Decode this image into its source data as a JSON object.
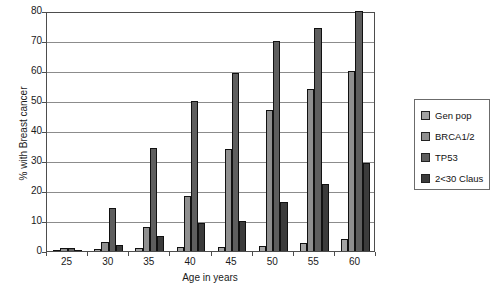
{
  "chart_data": {
    "type": "bar",
    "title": "",
    "xlabel": "Age in years",
    "ylabel": "% with Breast cancer",
    "categories": [
      "25",
      "30",
      "35",
      "40",
      "45",
      "50",
      "55",
      "60"
    ],
    "ylim": [
      0,
      80
    ],
    "yticks": [
      0,
      10,
      20,
      30,
      40,
      50,
      60,
      70,
      80
    ],
    "grid": true,
    "legend_position": "right",
    "series": [
      {
        "name": "Gen pop",
        "color": "#a3a3a3",
        "values": [
          0.4,
          0.8,
          1.0,
          1.2,
          1.5,
          1.8,
          2.8,
          4.0
        ]
      },
      {
        "name": "BRCA1/2",
        "color": "#8f8f8f",
        "values": [
          1.0,
          3.0,
          8.0,
          18.5,
          34.0,
          47.0,
          54.0,
          60.0
        ]
      },
      {
        "name": "TP53",
        "color": "#5e5e5e",
        "values": [
          1.0,
          14.5,
          34.5,
          50.0,
          59.5,
          70.0,
          74.5,
          80.0
        ]
      },
      {
        "name": "2<30 Claus",
        "color": "#3b3b3b",
        "values": [
          0.3,
          2.0,
          5.0,
          9.5,
          10.0,
          16.5,
          22.5,
          29.5
        ]
      }
    ]
  }
}
